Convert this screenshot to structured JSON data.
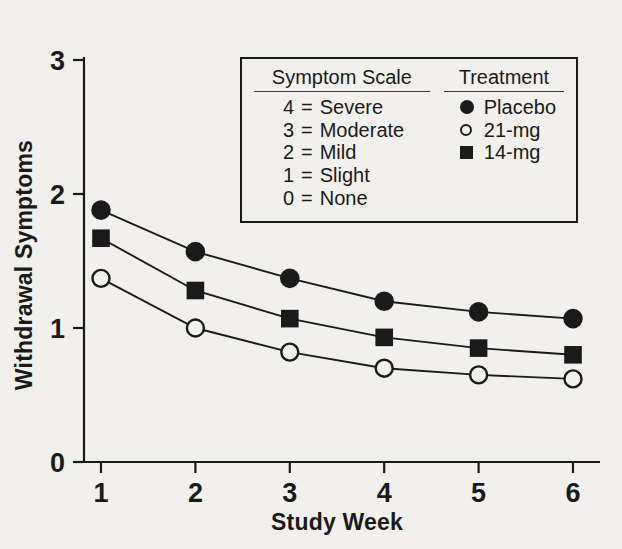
{
  "chart_data": {
    "type": "line",
    "title": "",
    "xlabel": "Study Week",
    "ylabel": "Withdrawal Symptoms",
    "x": [
      1,
      2,
      3,
      4,
      5,
      6
    ],
    "categories": [
      "1",
      "2",
      "3",
      "4",
      "5",
      "6"
    ],
    "xtick_labels": [
      "1",
      "2",
      "3",
      "4",
      "5",
      "6"
    ],
    "ytick_labels": [
      "0",
      "1",
      "2",
      "3"
    ],
    "ytick_values": [
      0,
      1,
      2,
      3
    ],
    "xlim": [
      0.72,
      6.28
    ],
    "ylim": [
      0,
      3
    ],
    "grid": false,
    "legend_position": "upper-center-inside",
    "series": [
      {
        "name": "Placebo",
        "marker": "filled-circle",
        "values": [
          1.88,
          1.57,
          1.37,
          1.2,
          1.12,
          1.07
        ]
      },
      {
        "name": "14-mg",
        "marker": "filled-square",
        "values": [
          1.67,
          1.28,
          1.07,
          0.93,
          0.85,
          0.8
        ]
      },
      {
        "name": "21-mg",
        "marker": "open-circle",
        "values": [
          1.37,
          1.0,
          0.82,
          0.7,
          0.65,
          0.62
        ]
      }
    ]
  },
  "axes": {
    "y_title": "Withdrawal Symptoms",
    "x_title": "Study Week",
    "y_ticks": [
      "3",
      "2",
      "1",
      "0"
    ],
    "x_ticks": [
      "1",
      "2",
      "3",
      "4",
      "5",
      "6"
    ]
  },
  "legend": {
    "scale": {
      "heading": "Symptom Scale",
      "rows": [
        {
          "num": "4",
          "eq": "=",
          "label": "Severe"
        },
        {
          "num": "3",
          "eq": "=",
          "label": "Moderate"
        },
        {
          "num": "2",
          "eq": "=",
          "label": "Mild"
        },
        {
          "num": "1",
          "eq": "=",
          "label": "Slight"
        },
        {
          "num": "0",
          "eq": "=",
          "label": "None"
        }
      ]
    },
    "treatment": {
      "heading": "Treatment",
      "rows": [
        {
          "marker": "filled-circle",
          "label": "Placebo"
        },
        {
          "marker": "open-circle",
          "label": "21-mg"
        },
        {
          "marker": "filled-square",
          "label": "14-mg"
        }
      ]
    }
  },
  "colors": {
    "ink": "#1a1a1a",
    "background": "#f2f0ec"
  }
}
